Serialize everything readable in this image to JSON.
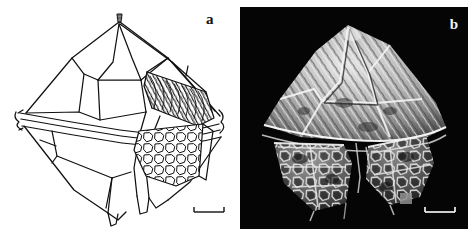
{
  "figure": {
    "caption_present": false,
    "background_color": "#ffffff",
    "panel_count": 2
  },
  "panels": [
    {
      "id": "a",
      "label": "a",
      "label_color": "#101010",
      "type": "line-drawing",
      "background_color": "#ffffff",
      "line_color": "#000000",
      "subject": "dinoflagellate-cyst",
      "description": "Line drawing of a biconical dinoflagellate cyst in ventral view with apical horn, cingulum and antapical horns",
      "scalebar": {
        "color": "#000000",
        "length_px": 30,
        "label": ""
      }
    },
    {
      "id": "b",
      "label": "b",
      "label_color": "#f2f2f2",
      "type": "sem-micrograph",
      "background_color": "#050505",
      "subject": "dinoflagellate-cyst",
      "description": "Scanning electron micrograph of a biconical dinoflagellate cyst showing reticulate ornamentation",
      "scalebar": {
        "color": "#ffffff",
        "length_px": 30,
        "label": ""
      }
    }
  ]
}
